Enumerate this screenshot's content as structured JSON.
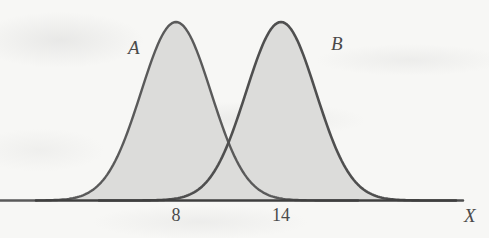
{
  "chart_data": {
    "type": "line",
    "title": "",
    "subtitle": "",
    "xlabel": "X",
    "ylabel": "",
    "grid": false,
    "legend_position": "inline-annotation",
    "xlim": [
      0,
      24
    ],
    "ylim": [
      0,
      1
    ],
    "xticks": [
      "8",
      "14"
    ],
    "xtick_values": [
      8,
      14
    ],
    "annotations": [
      {
        "text": "A",
        "series": "A",
        "x": 5.6,
        "y": 0.86
      },
      {
        "text": "B",
        "series": "B",
        "x": 17.2,
        "y": 0.88
      }
    ],
    "series": [
      {
        "name": "A",
        "label": "A",
        "kind": "normal-density",
        "mean": 8,
        "peak_x": 8,
        "peak_y": 1.0,
        "fill": true,
        "x": [
          0.0,
          1.0,
          2.0,
          3.0,
          4.0,
          5.0,
          6.0,
          7.0,
          8.0,
          9.0,
          10.0,
          11.0,
          12.0,
          13.0,
          14.0,
          15.0,
          16.0
        ],
        "y": [
          0.011,
          0.029,
          0.069,
          0.146,
          0.278,
          0.472,
          0.715,
          0.938,
          1.0,
          0.938,
          0.715,
          0.472,
          0.278,
          0.146,
          0.069,
          0.029,
          0.011
        ]
      },
      {
        "name": "B",
        "label": "B",
        "kind": "normal-density",
        "mean": 14,
        "peak_x": 14,
        "peak_y": 1.0,
        "fill": true,
        "x": [
          6.0,
          7.0,
          8.0,
          9.0,
          10.0,
          11.0,
          12.0,
          13.0,
          14.0,
          15.0,
          16.0,
          17.0,
          18.0,
          19.0,
          20.0,
          21.0,
          22.0
        ],
        "y": [
          0.011,
          0.029,
          0.069,
          0.146,
          0.278,
          0.472,
          0.715,
          0.938,
          1.0,
          0.938,
          0.715,
          0.472,
          0.278,
          0.146,
          0.069,
          0.029,
          0.011
        ]
      }
    ],
    "intersection": {
      "x": 11,
      "y": 0.472
    },
    "colors": {
      "curve_stroke": "#5a5a5a",
      "curve_fill": "#dcdcda",
      "axis": "#3f3f3f",
      "text": "#4a4a4a",
      "background": "#f7f7f5"
    }
  },
  "figure": {
    "curve_a_label": "A",
    "curve_b_label": "B",
    "tick_8": "8",
    "tick_14": "14",
    "axis_label_x": "X"
  }
}
